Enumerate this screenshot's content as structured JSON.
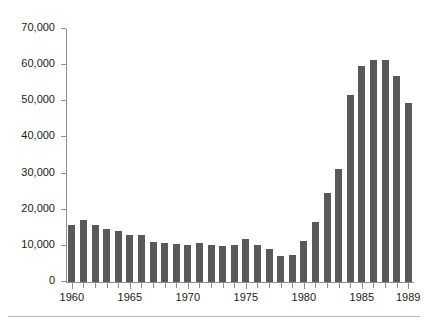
{
  "chart_data": {
    "type": "bar",
    "title": "",
    "subtitle": "",
    "xlabel": "",
    "ylabel": "",
    "xlim": [
      1959.5,
      1989.5
    ],
    "ylim": [
      0,
      70000
    ],
    "grid": false,
    "legend": null,
    "bar_color": "#595959",
    "axis_color": "#8e8e8e",
    "text_color": "#1b1b1b",
    "y_ticks": [
      0,
      10000,
      20000,
      30000,
      40000,
      50000,
      60000,
      70000
    ],
    "y_tick_labels": [
      "0",
      "10,000",
      "20,000",
      "30,000",
      "40,000",
      "50,000",
      "60,000",
      "70,000"
    ],
    "x_tick_labels": [
      "1960",
      "1965",
      "1970",
      "1975",
      "1980",
      "1985",
      "1989"
    ],
    "x_tick_values": [
      1960,
      1965,
      1970,
      1975,
      1980,
      1985,
      1989
    ],
    "categories": [
      "1960",
      "1961",
      "1962",
      "1963",
      "1964",
      "1965",
      "1966",
      "1967",
      "1968",
      "1969",
      "1970",
      "1971",
      "1972",
      "1973",
      "1974",
      "1975",
      "1976",
      "1977",
      "1978",
      "1979",
      "1980",
      "1981",
      "1982",
      "1983",
      "1984",
      "1985",
      "1986",
      "1987",
      "1988",
      "1989"
    ],
    "values": [
      15800,
      17200,
      15900,
      14700,
      14000,
      13100,
      13000,
      11200,
      10900,
      10600,
      10300,
      10800,
      10200,
      10100,
      10300,
      11800,
      10200,
      9000,
      7100,
      7500,
      11400,
      16600,
      24600,
      31200,
      51800,
      59700,
      61300,
      61400,
      57000,
      49600
    ]
  }
}
